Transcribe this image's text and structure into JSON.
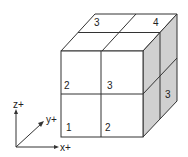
{
  "diagram": {
    "colors": {
      "line": "#333333",
      "front_face": "#ffffff",
      "top_face": "#ffffff",
      "right_face": "#d0d0d0"
    },
    "top_face_labels": [
      "3",
      "4"
    ],
    "front_face_labels": {
      "upper_left": "2",
      "upper_right": "3",
      "lower_left": "1",
      "lower_right": "2"
    },
    "right_face_labels": [
      "3"
    ],
    "axes": {
      "z": "z+",
      "y": "y+",
      "x": "x+"
    }
  }
}
